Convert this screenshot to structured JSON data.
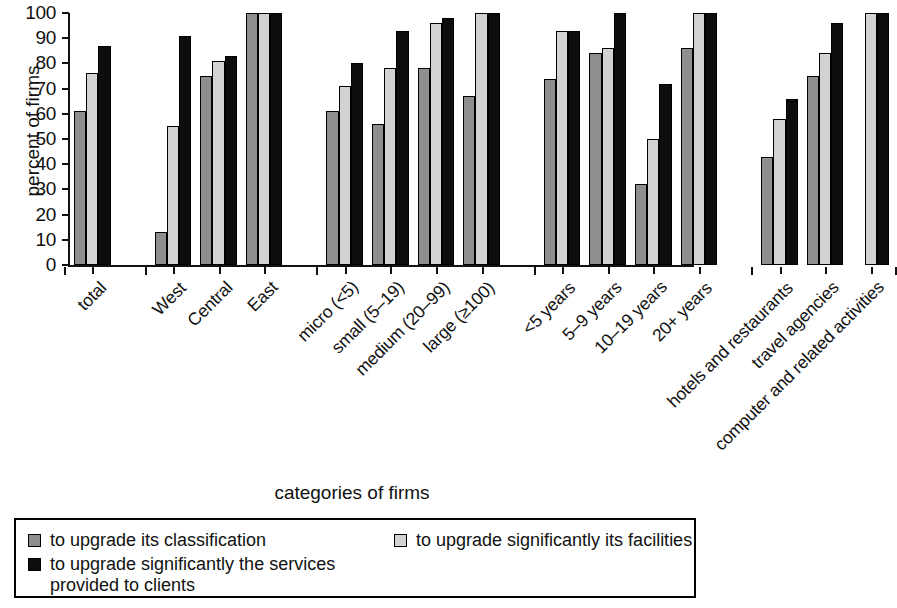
{
  "chart_data": {
    "type": "bar",
    "title": "",
    "xlabel": "categories of firms",
    "ylabel": "percent of firms",
    "ylim": [
      0,
      100
    ],
    "yticks": [
      0,
      10,
      20,
      30,
      40,
      50,
      60,
      70,
      80,
      90,
      100
    ],
    "grid": false,
    "legend_position": "bottom",
    "orientation": "vertical",
    "group_separators": [
      "total",
      "region",
      "size",
      "age",
      "sector"
    ],
    "categories": [
      "total",
      "West",
      "Central",
      "East",
      "micro (<5)",
      "small (5–19)",
      "medium (20–99)",
      "large (≥100)",
      "<5 years",
      "5–9 years",
      "10–19 years",
      "20+ years",
      "hotels and restaurants",
      "travel agencies",
      "computer and related activities"
    ],
    "series": [
      {
        "name": "to upgrade its classification",
        "color": "#8e8e8e",
        "values": [
          61,
          13,
          75,
          100,
          61,
          56,
          78,
          67,
          74,
          84,
          32,
          86,
          43,
          75,
          null
        ]
      },
      {
        "name": "to upgrade significantly its facilities",
        "color": "#d2d2d2",
        "values": [
          76,
          55,
          81,
          100,
          71,
          78,
          96,
          100,
          93,
          86,
          50,
          100,
          58,
          84,
          100
        ]
      },
      {
        "name": "to upgrade significantly the services provided to clients",
        "color": "#0d0d0d",
        "values": [
          87,
          91,
          83,
          100,
          80,
          93,
          98,
          100,
          93,
          100,
          72,
          100,
          66,
          96,
          100
        ]
      }
    ]
  },
  "axis": {
    "y_title": "percent of firms",
    "x_title": "categories of firms",
    "y_tick_labels": [
      "100",
      "90",
      "80",
      "70",
      "60",
      "50",
      "40",
      "30",
      "20",
      "10",
      "0"
    ]
  },
  "legend": {
    "items": [
      {
        "label": "to upgrade its classification",
        "color": "#8e8e8e"
      },
      {
        "label": "to upgrade significantly its facilities",
        "color": "#d2d2d2"
      },
      {
        "label": "to upgrade significantly the services\nprovided to clients",
        "color": "#0d0d0d"
      }
    ]
  }
}
